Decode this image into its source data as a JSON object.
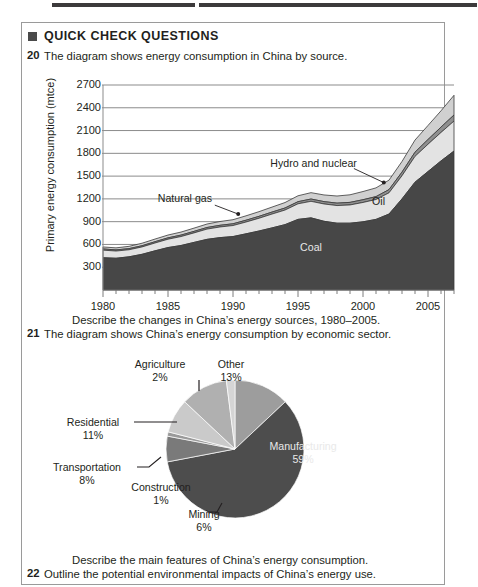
{
  "page": {
    "panel_title": "QUICK CHECK QUESTIONS",
    "bullet_icon": "filled-square-icon"
  },
  "questions": [
    {
      "number": "20",
      "text": "The diagram shows energy consumption in China by source."
    },
    {
      "number": "",
      "text": "Describe the changes in China’s energy sources, 1980–2005."
    },
    {
      "number": "21",
      "text": "The diagram shows China’s energy consumption by economic sector."
    },
    {
      "number": "",
      "text": "Describe the main features of China’s energy consumption."
    },
    {
      "number": "22",
      "text": "Outline the potential environmental impacts of China’s energy use."
    }
  ],
  "chart_data": [
    {
      "type": "area",
      "title": "",
      "xlabel": "",
      "ylabel": "Primary energy consumption (mtce)",
      "ylim": [
        0,
        2700
      ],
      "xlim": [
        1980,
        2007
      ],
      "grid": true,
      "legend_position": "inline-annotations",
      "yticks": [
        "2700",
        "2400",
        "2100",
        "1800",
        "1500",
        "1200",
        "900",
        "600",
        "300"
      ],
      "xticks": [
        "1980",
        "1985",
        "1990",
        "1995",
        "2000",
        "2005"
      ],
      "annotations": [
        "Coal",
        "Oil",
        "Natural gas",
        "Hydro and nuclear"
      ],
      "x": [
        1980,
        1981,
        1982,
        1983,
        1984,
        1985,
        1986,
        1987,
        1988,
        1989,
        1990,
        1991,
        1992,
        1993,
        1994,
        1995,
        1996,
        1997,
        1998,
        1999,
        2000,
        2001,
        2002,
        2003,
        2004,
        2005,
        2006,
        2007
      ],
      "series": [
        {
          "name": "Coal",
          "color": "#474747",
          "values": [
            425,
            418,
            437,
            470,
            516,
            559,
            586,
            627,
            667,
            690,
            704,
            740,
            777,
            818,
            861,
            930,
            950,
            905,
            880,
            880,
            898,
            930,
            1000,
            1200,
            1420,
            1560,
            1700,
            1830
          ]
        },
        {
          "name": "Oil",
          "color": "#e3e3e3",
          "values": [
            100,
            95,
            93,
            97,
            103,
            110,
            118,
            125,
            135,
            140,
            145,
            155,
            168,
            182,
            192,
            205,
            218,
            228,
            232,
            240,
            255,
            262,
            280,
            305,
            340,
            360,
            375,
            395
          ]
        },
        {
          "name": "Natural gas",
          "color": "#8f8f8f",
          "values": [
            16,
            15,
            15,
            16,
            17,
            18,
            19,
            20,
            21,
            22,
            23,
            24,
            25,
            26,
            27,
            28,
            30,
            31,
            32,
            34,
            36,
            38,
            42,
            48,
            55,
            62,
            70,
            80
          ]
        },
        {
          "name": "Hydro and nuclear",
          "color": "#d0d0d0",
          "values": [
            26,
            27,
            30,
            33,
            35,
            37,
            40,
            43,
            46,
            50,
            54,
            58,
            62,
            66,
            72,
            78,
            84,
            88,
            94,
            100,
            108,
            115,
            125,
            140,
            160,
            185,
            215,
            260
          ]
        }
      ]
    },
    {
      "type": "pie",
      "title": "",
      "legend_position": "callout-labels",
      "categories": [
        "Manufacturing",
        "Other",
        "Agriculture",
        "Residential",
        "Transportation",
        "Construction",
        "Mining"
      ],
      "values": [
        59,
        13,
        2,
        11,
        8,
        1,
        6
      ],
      "labels": [
        {
          "name": "Manufacturing",
          "percent": "59%",
          "color": "#4d4d4d"
        },
        {
          "name": "Other",
          "percent": "13%",
          "color": "#9d9d9d"
        },
        {
          "name": "Agriculture",
          "percent": "2%",
          "color": "#d5d5d5"
        },
        {
          "name": "Residential",
          "percent": "11%",
          "color": "#b0b0b0"
        },
        {
          "name": "Transportation",
          "percent": "8%",
          "color": "#cacaca"
        },
        {
          "name": "Construction",
          "percent": "1%",
          "color": "#9a9a9a"
        },
        {
          "name": "Mining",
          "percent": "6%",
          "color": "#7a7a7a"
        }
      ]
    }
  ]
}
